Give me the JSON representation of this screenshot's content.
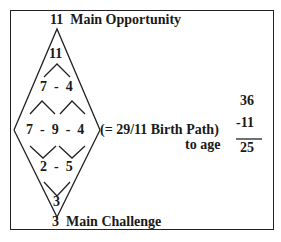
{
  "diagram": {
    "top_label": "11  Main Opportunity",
    "bottom_label": "3  Main Challenge",
    "apex_top": "11",
    "row2": "7  -  4",
    "row3": "7  -  9  -  4",
    "row4": "2  -  5",
    "apex_bottom": "3",
    "birth_path_note": "(= 29/11 Birth Path)",
    "to_age_label": "to age",
    "calc": {
      "top": "36",
      "subtract": "-11",
      "result": "25"
    }
  }
}
